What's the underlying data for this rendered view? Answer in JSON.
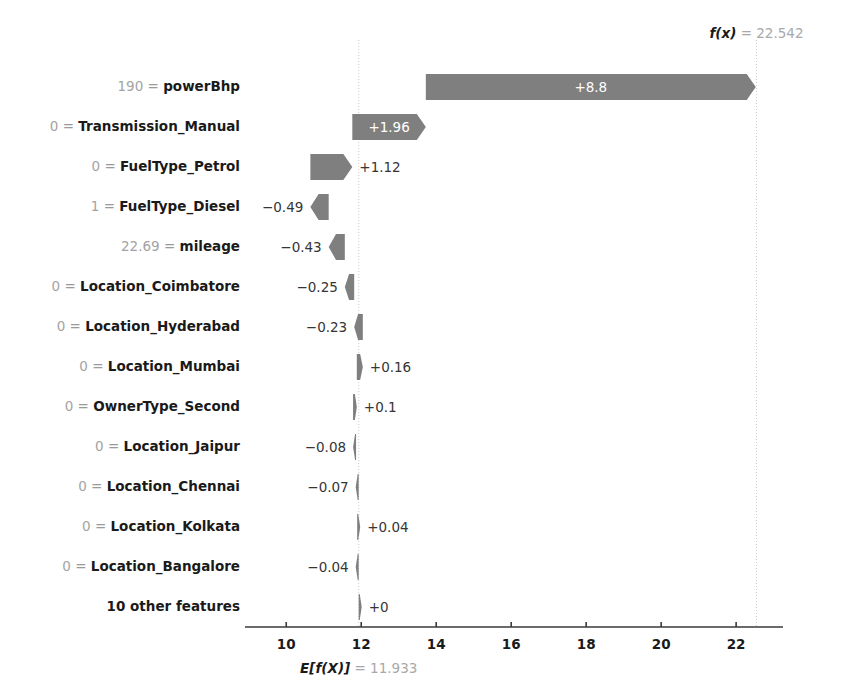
{
  "chart_data": {
    "type": "bar",
    "chart_style": "shap-waterfall",
    "title": "",
    "xlabel": "",
    "ylabel": "",
    "base_value": 11.933,
    "base_value_label": "E[f(X)] = 11.933",
    "base_value_prefix": "E[f(X)]",
    "base_value_number": "11.933",
    "output_value": 22.542,
    "output_value_label": "f(x) = 22.542",
    "output_value_prefix": "f(x)",
    "output_value_number": "22.542",
    "xlim": [
      8.9,
      23.25
    ],
    "xticks": [
      10,
      12,
      14,
      16,
      18,
      20,
      22
    ],
    "xtick_labels": [
      "10",
      "12",
      "14",
      "16",
      "18",
      "20",
      "22"
    ],
    "grid": false,
    "legend": false,
    "bar_color": "#7f7f7f",
    "rows": [
      {
        "feature": "powerBhp",
        "value": "190",
        "shap": 8.8,
        "label": "+8.8",
        "label_inside": true
      },
      {
        "feature": "Transmission_Manual",
        "value": "0",
        "shap": 1.96,
        "label": "+1.96",
        "label_inside": true
      },
      {
        "feature": "FuelType_Petrol",
        "value": "0",
        "shap": 1.12,
        "label": "+1.12",
        "label_inside": false
      },
      {
        "feature": "FuelType_Diesel",
        "value": "1",
        "shap": -0.49,
        "label": "−0.49",
        "label_inside": false
      },
      {
        "feature": "mileage",
        "value": "22.69",
        "shap": -0.43,
        "label": "−0.43",
        "label_inside": false
      },
      {
        "feature": "Location_Coimbatore",
        "value": "0",
        "shap": -0.25,
        "label": "−0.25",
        "label_inside": false
      },
      {
        "feature": "Location_Hyderabad",
        "value": "0",
        "shap": -0.23,
        "label": "−0.23",
        "label_inside": false
      },
      {
        "feature": "Location_Mumbai",
        "value": "0",
        "shap": 0.16,
        "label": "+0.16",
        "label_inside": false
      },
      {
        "feature": "OwnerType_Second",
        "value": "0",
        "shap": 0.1,
        "label": "+0.1",
        "label_inside": false
      },
      {
        "feature": "Location_Jaipur",
        "value": "0",
        "shap": -0.08,
        "label": "−0.08",
        "label_inside": false
      },
      {
        "feature": "Location_Chennai",
        "value": "0",
        "shap": -0.07,
        "label": "−0.07",
        "label_inside": false
      },
      {
        "feature": "Location_Kolkata",
        "value": "0",
        "shap": 0.04,
        "label": "+0.04",
        "label_inside": false
      },
      {
        "feature": "Location_Bangalore",
        "value": "0",
        "shap": -0.04,
        "label": "−0.04",
        "label_inside": false
      },
      {
        "feature": "10 other features",
        "value": "",
        "shap": 0.0,
        "label": "+0",
        "label_inside": false
      }
    ]
  }
}
